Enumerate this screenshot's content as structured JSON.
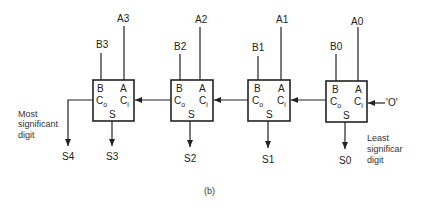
{
  "diagram": {
    "caption": "(b)",
    "carry_in_value": "'O'",
    "cell_labels": {
      "b": "B",
      "a": "A",
      "co": "C",
      "co_sub": "o",
      "ci": "C",
      "ci_sub": "i",
      "s": "S"
    },
    "cells": [
      {
        "bit": 3,
        "b_input": "B3",
        "a_input": "A3",
        "sum_output": "S3",
        "x": 93
      },
      {
        "bit": 2,
        "b_input": "B2",
        "a_input": "A2",
        "sum_output": "S2",
        "x": 171
      },
      {
        "bit": 1,
        "b_input": "B1",
        "a_input": "A1",
        "sum_output": "S1",
        "x": 248
      },
      {
        "bit": 0,
        "b_input": "B0",
        "a_input": "A0",
        "sum_output": "S0",
        "x": 326
      }
    ],
    "carry_out_output": "S4",
    "msd_note": [
      "Most",
      "significant",
      "digit"
    ],
    "lsd_note": [
      "Least",
      "significar",
      "digit"
    ],
    "colors": {
      "line": "#222222",
      "background": "#ffffff"
    }
  }
}
